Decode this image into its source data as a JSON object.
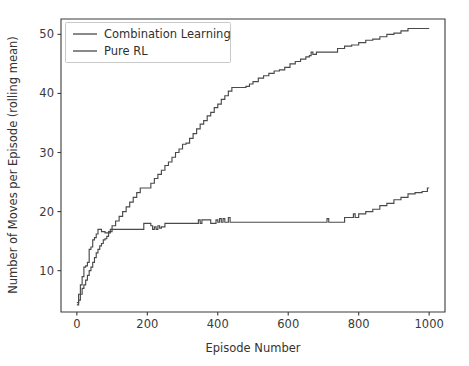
{
  "chart_data": {
    "type": "line",
    "title": "",
    "xlabel": "Episode Number",
    "ylabel": "Number of Moves per Episode (rolling mean)",
    "xlim": [
      -45,
      1045
    ],
    "ylim": [
      3.0,
      52.6
    ],
    "xticks": [
      0,
      200,
      400,
      600,
      800,
      1000
    ],
    "xtick_labels": [
      "0",
      "200",
      "400",
      "600",
      "800",
      "1000"
    ],
    "yticks": [
      10,
      20,
      30,
      40,
      50
    ],
    "ytick_labels": [
      "10",
      "20",
      "30",
      "40",
      "50"
    ],
    "grid": false,
    "legend_position": "upper left",
    "line_color": "#4a4a4a",
    "background_color": "#ffffff",
    "axis_color": "#3b3b3b",
    "series": [
      {
        "name": "Combination Learning",
        "color": "#4a4a4a",
        "x": [
          0,
          5,
          10,
          15,
          20,
          25,
          30,
          35,
          40,
          45,
          50,
          55,
          60,
          65,
          70,
          75,
          80,
          85,
          90,
          95,
          100,
          110,
          120,
          130,
          140,
          150,
          160,
          170,
          180,
          190,
          200,
          210,
          220,
          230,
          240,
          250,
          260,
          270,
          280,
          290,
          300,
          310,
          320,
          330,
          340,
          350,
          360,
          370,
          380,
          390,
          400,
          410,
          420,
          430,
          440,
          450,
          460,
          470,
          480,
          490,
          500,
          515,
          530,
          545,
          560,
          575,
          590,
          605,
          620,
          635,
          650,
          660,
          665,
          670,
          680,
          700,
          720,
          740,
          760,
          780,
          800,
          820,
          840,
          860,
          880,
          900,
          920,
          940,
          960,
          980,
          1000
        ],
        "y": [
          4.2,
          5.0,
          6.0,
          7.0,
          7.6,
          8.4,
          9.2,
          10.0,
          10.6,
          11.4,
          12.2,
          13.0,
          13.6,
          14.2,
          14.6,
          15.2,
          15.4,
          15.8,
          16.4,
          17.0,
          17.6,
          18.4,
          19.2,
          20.0,
          20.8,
          21.6,
          22.4,
          23.2,
          24.0,
          24.0,
          24.0,
          24.8,
          25.6,
          26.3,
          27.0,
          27.8,
          28.4,
          29.2,
          30.0,
          30.6,
          31.4,
          31.6,
          32.4,
          33.2,
          34.0,
          34.8,
          35.4,
          36.2,
          36.8,
          37.6,
          38.2,
          39.0,
          39.6,
          40.4,
          41.0,
          41.0,
          41.0,
          41.0,
          41.2,
          41.6,
          42.0,
          42.6,
          43.0,
          43.4,
          43.8,
          44.0,
          44.4,
          45.0,
          45.4,
          45.8,
          46.2,
          46.4,
          47.0,
          46.6,
          47.0,
          47.0,
          47.0,
          47.6,
          48.0,
          48.2,
          48.6,
          49.0,
          49.2,
          49.6,
          50.0,
          50.2,
          50.6,
          51.0,
          51.0,
          51.0,
          51.0
        ]
      },
      {
        "name": "Pure RL",
        "color": "#4a4a4a",
        "x": [
          0,
          5,
          10,
          15,
          20,
          25,
          30,
          35,
          40,
          45,
          50,
          55,
          60,
          65,
          70,
          80,
          90,
          100,
          120,
          140,
          160,
          180,
          190,
          200,
          210,
          215,
          220,
          225,
          230,
          235,
          240,
          250,
          280,
          320,
          345,
          350,
          355,
          380,
          395,
          400,
          405,
          410,
          415,
          420,
          425,
          430,
          435,
          440,
          460,
          500,
          560,
          620,
          680,
          705,
          710,
          715,
          720,
          740,
          760,
          780,
          785,
          790,
          800,
          820,
          840,
          860,
          880,
          900,
          920,
          940,
          960,
          980,
          995,
          1000
        ],
        "y": [
          4.6,
          6.0,
          7.6,
          9.0,
          10.6,
          10.8,
          11.4,
          13.6,
          14.0,
          15.2,
          15.6,
          16.2,
          17.0,
          17.0,
          16.6,
          16.4,
          16.6,
          17.0,
          17.0,
          17.0,
          17.0,
          17.0,
          18.0,
          18.0,
          17.6,
          17.0,
          17.4,
          17.0,
          17.6,
          17.2,
          17.4,
          18.0,
          18.0,
          18.0,
          18.6,
          18.0,
          18.6,
          18.0,
          18.6,
          18.2,
          18.8,
          18.2,
          18.8,
          18.2,
          18.2,
          19.0,
          18.2,
          18.2,
          18.2,
          18.2,
          18.2,
          18.2,
          18.2,
          18.2,
          18.8,
          18.2,
          18.2,
          18.2,
          19.0,
          19.0,
          19.6,
          19.0,
          19.6,
          20.0,
          20.4,
          21.0,
          21.4,
          22.0,
          22.4,
          23.0,
          23.2,
          23.4,
          24.0,
          24.0
        ]
      }
    ]
  },
  "legend": {
    "entries": [
      {
        "label": "Combination Learning"
      },
      {
        "label": "Pure RL"
      }
    ]
  }
}
